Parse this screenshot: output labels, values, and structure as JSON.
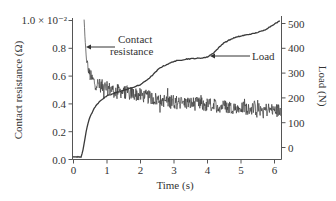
{
  "chart_data": {
    "type": "line",
    "title": "",
    "xlabel": "Time (s)",
    "ylabel": "Contact resistance (Ω)",
    "ylabel_right": "Load (N)",
    "xlim": [
      0,
      6.2
    ],
    "ylim": [
      0.0,
      1.0
    ],
    "ylim_right": [
      -50,
      510
    ],
    "y_multiplier_label": "× 10⁻²",
    "grid": false,
    "legend": "none (inline annotations)",
    "x_ticks": [
      "0",
      "1",
      "2",
      "3",
      "4",
      "5",
      "6"
    ],
    "y_ticks": [
      "0.0",
      "0.2",
      "0.4",
      "0.6",
      "0.8",
      "1.0"
    ],
    "y_ticks_right": [
      "0",
      "100",
      "200",
      "300",
      "400",
      "500"
    ],
    "annotations": [
      {
        "text_lines": [
          "Contact",
          "resistance"
        ],
        "points_to": "Contact resistance",
        "at": [
          0.4,
          0.8
        ]
      },
      {
        "text_lines": [
          "Load"
        ],
        "points_to": "Load",
        "at": [
          4.0,
          360
        ]
      }
    ],
    "series": [
      {
        "name": "Contact resistance",
        "axis": "left",
        "units": "Ω ×10⁻²",
        "noisy": true,
        "noise_amplitude": 0.05,
        "x": [
          0.33,
          0.36,
          0.4,
          0.45,
          0.55,
          0.65,
          0.8,
          1.0,
          1.3,
          1.6,
          2.0,
          2.5,
          3.0,
          3.5,
          4.0,
          4.5,
          5.0,
          5.5,
          6.0,
          6.2
        ],
        "values": [
          1.0,
          0.85,
          0.72,
          0.64,
          0.58,
          0.55,
          0.53,
          0.51,
          0.49,
          0.48,
          0.46,
          0.43,
          0.41,
          0.4,
          0.39,
          0.38,
          0.37,
          0.36,
          0.35,
          0.35
        ]
      },
      {
        "name": "Load",
        "axis": "right",
        "units": "N",
        "noisy": false,
        "x": [
          0.0,
          0.25,
          0.3,
          0.4,
          0.5,
          0.65,
          0.8,
          1.0,
          1.3,
          1.6,
          2.0,
          2.3,
          2.6,
          3.0,
          3.4,
          3.8,
          4.0,
          4.2,
          4.5,
          4.8,
          5.1,
          5.4,
          5.7,
          6.0,
          6.2
        ],
        "values": [
          -40,
          -40,
          -10,
          70,
          120,
          160,
          185,
          205,
          220,
          232,
          250,
          280,
          320,
          345,
          355,
          358,
          362,
          380,
          420,
          440,
          450,
          458,
          470,
          495,
          510
        ]
      }
    ]
  },
  "labels": {
    "y_multiplier": "1.0 × 10⁻²",
    "ylabel_left": "Contact resistance (Ω)",
    "ylabel_right": "Load (N)",
    "xlabel": "Time (s)",
    "annot_resistance_line1": "Contact",
    "annot_resistance_line2": "resistance",
    "annot_load": "Load"
  },
  "colors": {
    "curve": "#3a3a3a",
    "axis": "#555555",
    "text": "#333333",
    "background": "#ffffff"
  }
}
